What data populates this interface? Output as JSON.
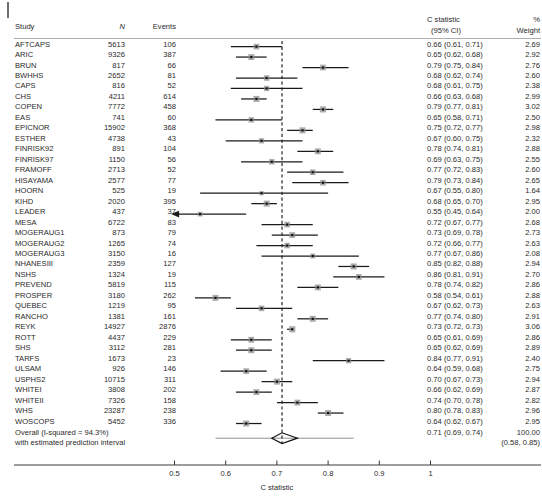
{
  "corner_mark": "tick-mark",
  "headers": {
    "study": "Study",
    "n": "N",
    "events": "Events",
    "cstat_line1": "C statistic",
    "cstat_line2": "(95% CI)",
    "weight_line1": "%",
    "weight_line2": "Weight"
  },
  "axis": {
    "title": "C statistic",
    "ticks": [
      "0.5",
      "0.6",
      "0.7",
      "0.8",
      "0.9",
      "1"
    ],
    "tick_values": [
      0.5,
      0.6,
      0.7,
      0.8,
      0.9,
      1.0
    ],
    "min": 0.45,
    "max": 1.02,
    "reference_line": 0.71
  },
  "footer": {
    "line1": "Overall (I-squared = 94.3%)",
    "line2": "with estimated prediction interval",
    "overall_cstat": "0.71 (0.69, 0.74)",
    "overall_weight": "100.00",
    "prediction_interval": "(0.58, 0.85)"
  },
  "colors": {
    "marker_box": "#8c8c8c",
    "marker_center": "#111111",
    "ci_line": "#1a1a1a",
    "reference_line": "#111111",
    "axis": "#3a3a3a",
    "rule": "#9a9a9a",
    "diamond": "#111111"
  },
  "chart_data": {
    "type": "forest",
    "title": "",
    "xlabel": "C statistic",
    "ylabel": "",
    "xlim": [
      0.45,
      1.02
    ],
    "grid": false,
    "reference_line": 0.71,
    "columns": [
      "Study",
      "N",
      "Events",
      "C statistic (95% CI)",
      "% Weight"
    ],
    "rows": [
      {
        "study": "AFTCAPS",
        "n": "5613",
        "events": "106",
        "est": 0.66,
        "lo": 0.61,
        "hi": 0.71,
        "cstat": "0.66 (0.61, 0.71)",
        "weight": "2.69",
        "arrow": false
      },
      {
        "study": "ARIC",
        "n": "9326",
        "events": "387",
        "est": 0.65,
        "lo": 0.62,
        "hi": 0.68,
        "cstat": "0.65 (0.62, 0.68)",
        "weight": "2.92",
        "arrow": false
      },
      {
        "study": "BRUN",
        "n": "817",
        "events": "66",
        "est": 0.79,
        "lo": 0.75,
        "hi": 0.84,
        "cstat": "0.79 (0.75, 0.84)",
        "weight": "2.76",
        "arrow": false
      },
      {
        "study": "BWHHS",
        "n": "2652",
        "events": "81",
        "est": 0.68,
        "lo": 0.62,
        "hi": 0.74,
        "cstat": "0.68 (0.62, 0.74)",
        "weight": "2.60",
        "arrow": false
      },
      {
        "study": "CAPS",
        "n": "816",
        "events": "52",
        "est": 0.68,
        "lo": 0.61,
        "hi": 0.75,
        "cstat": "0.68 (0.61, 0.75)",
        "weight": "2.38",
        "arrow": false
      },
      {
        "study": "CHS",
        "n": "4211",
        "events": "614",
        "est": 0.66,
        "lo": 0.63,
        "hi": 0.68,
        "cstat": "0.66 (0.63, 0.68)",
        "weight": "2.99",
        "arrow": false
      },
      {
        "study": "COPEN",
        "n": "7772",
        "events": "458",
        "est": 0.79,
        "lo": 0.77,
        "hi": 0.81,
        "cstat": "0.79 (0.77, 0.81)",
        "weight": "3.02",
        "arrow": false
      },
      {
        "study": "EAS",
        "n": "741",
        "events": "60",
        "est": 0.65,
        "lo": 0.58,
        "hi": 0.71,
        "cstat": "0.65 (0.58, 0.71)",
        "weight": "2.50",
        "arrow": false
      },
      {
        "study": "EPICNOR",
        "n": "15902",
        "events": "368",
        "est": 0.75,
        "lo": 0.72,
        "hi": 0.77,
        "cstat": "0.75 (0.72, 0.77)",
        "weight": "2.98",
        "arrow": false
      },
      {
        "study": "ESTHER",
        "n": "4738",
        "events": "43",
        "est": 0.67,
        "lo": 0.6,
        "hi": 0.75,
        "cstat": "0.67 (0.60, 0.75)",
        "weight": "2.32",
        "arrow": false
      },
      {
        "study": "FINRISK92",
        "n": "891",
        "events": "104",
        "est": 0.78,
        "lo": 0.74,
        "hi": 0.81,
        "cstat": "0.78 (0.74, 0.81)",
        "weight": "2.88",
        "arrow": false
      },
      {
        "study": "FINRISK97",
        "n": "1150",
        "events": "56",
        "est": 0.69,
        "lo": 0.63,
        "hi": 0.75,
        "cstat": "0.69 (0.63, 0.75)",
        "weight": "2.55",
        "arrow": false
      },
      {
        "study": "FRAMOFF",
        "n": "2713",
        "events": "52",
        "est": 0.77,
        "lo": 0.72,
        "hi": 0.83,
        "cstat": "0.77 (0.72, 0.83)",
        "weight": "2.60",
        "arrow": false
      },
      {
        "study": "HISAYAMA",
        "n": "2577",
        "events": "77",
        "est": 0.79,
        "lo": 0.73,
        "hi": 0.84,
        "cstat": "0.79 (0.73, 0.84)",
        "weight": "2.65",
        "arrow": false
      },
      {
        "study": "HOORN",
        "n": "525",
        "events": "19",
        "est": 0.67,
        "lo": 0.55,
        "hi": 0.8,
        "cstat": "0.67 (0.55, 0.80)",
        "weight": "1.64",
        "arrow": false
      },
      {
        "study": "KIHD",
        "n": "2020",
        "events": "395",
        "est": 0.68,
        "lo": 0.65,
        "hi": 0.7,
        "cstat": "0.68 (0.65, 0.70)",
        "weight": "2.95",
        "arrow": false
      },
      {
        "study": "LEADER",
        "n": "437",
        "events": "37",
        "est": 0.55,
        "lo": 0.45,
        "hi": 0.64,
        "cstat": "0.55 (0.45, 0.64)",
        "weight": "2.00",
        "arrow": true
      },
      {
        "study": "MESA",
        "n": "6722",
        "events": "83",
        "est": 0.72,
        "lo": 0.67,
        "hi": 0.77,
        "cstat": "0.72 (0.67, 0.77)",
        "weight": "2.68",
        "arrow": false
      },
      {
        "study": "MOGERAUG1",
        "n": "873",
        "events": "79",
        "est": 0.73,
        "lo": 0.69,
        "hi": 0.78,
        "cstat": "0.73 (0.69, 0.78)",
        "weight": "2.73",
        "arrow": false
      },
      {
        "study": "MOGERAUG2",
        "n": "1265",
        "events": "74",
        "est": 0.72,
        "lo": 0.66,
        "hi": 0.77,
        "cstat": "0.72 (0.66, 0.77)",
        "weight": "2.63",
        "arrow": false
      },
      {
        "study": "MOGERAUG3",
        "n": "3150",
        "events": "16",
        "est": 0.77,
        "lo": 0.67,
        "hi": 0.86,
        "cstat": "0.77 (0.67, 0.86)",
        "weight": "2.08",
        "arrow": false
      },
      {
        "study": "NHANESIII",
        "n": "2359",
        "events": "127",
        "est": 0.85,
        "lo": 0.82,
        "hi": 0.88,
        "cstat": "0.85 (0.82, 0.88)",
        "weight": "2.94",
        "arrow": false
      },
      {
        "study": "NSHS",
        "n": "1324",
        "events": "19",
        "est": 0.86,
        "lo": 0.81,
        "hi": 0.91,
        "cstat": "0.86 (0.81, 0.91)",
        "weight": "2.70",
        "arrow": false
      },
      {
        "study": "PREVEND",
        "n": "5819",
        "events": "115",
        "est": 0.78,
        "lo": 0.74,
        "hi": 0.82,
        "cstat": "0.78 (0.74, 0.82)",
        "weight": "2.86",
        "arrow": false
      },
      {
        "study": "PROSPER",
        "n": "3180",
        "events": "262",
        "est": 0.58,
        "lo": 0.54,
        "hi": 0.61,
        "cstat": "0.58 (0.54, 0.61)",
        "weight": "2.88",
        "arrow": false
      },
      {
        "study": "QUEBEC",
        "n": "1219",
        "events": "95",
        "est": 0.67,
        "lo": 0.62,
        "hi": 0.73,
        "cstat": "0.67 (0.62, 0.73)",
        "weight": "2.63",
        "arrow": false
      },
      {
        "study": "RANCHO",
        "n": "1381",
        "events": "161",
        "est": 0.77,
        "lo": 0.74,
        "hi": 0.8,
        "cstat": "0.77 (0.74, 0.80)",
        "weight": "2.91",
        "arrow": false
      },
      {
        "study": "REYK",
        "n": "14927",
        "events": "2876",
        "est": 0.73,
        "lo": 0.72,
        "hi": 0.73,
        "cstat": "0.73 (0.72, 0.73)",
        "weight": "3.06",
        "arrow": false
      },
      {
        "study": "ROTT",
        "n": "4437",
        "events": "229",
        "est": 0.65,
        "lo": 0.61,
        "hi": 0.69,
        "cstat": "0.65 (0.61, 0.69)",
        "weight": "2.86",
        "arrow": false
      },
      {
        "study": "SHS",
        "n": "3112",
        "events": "281",
        "est": 0.65,
        "lo": 0.62,
        "hi": 0.69,
        "cstat": "0.65 (0.62, 0.69)",
        "weight": "2.89",
        "arrow": false
      },
      {
        "study": "TARFS",
        "n": "1673",
        "events": "23",
        "est": 0.84,
        "lo": 0.77,
        "hi": 0.91,
        "cstat": "0.84 (0.77, 0.91)",
        "weight": "2.40",
        "arrow": false
      },
      {
        "study": "ULSAM",
        "n": "926",
        "events": "146",
        "est": 0.64,
        "lo": 0.59,
        "hi": 0.68,
        "cstat": "0.64 (0.59, 0.68)",
        "weight": "2.75",
        "arrow": false
      },
      {
        "study": "USPHS2",
        "n": "10715",
        "events": "311",
        "est": 0.7,
        "lo": 0.67,
        "hi": 0.73,
        "cstat": "0.70 (0.67, 0.73)",
        "weight": "2.94",
        "arrow": false
      },
      {
        "study": "WHITEI",
        "n": "3808",
        "events": "202",
        "est": 0.66,
        "lo": 0.62,
        "hi": 0.69,
        "cstat": "0.66 (0.62, 0.69)",
        "weight": "2.87",
        "arrow": false
      },
      {
        "study": "WHITEII",
        "n": "7326",
        "events": "158",
        "est": 0.74,
        "lo": 0.7,
        "hi": 0.78,
        "cstat": "0.74 (0.70, 0.78)",
        "weight": "2.82",
        "arrow": false
      },
      {
        "study": "WHS",
        "n": "23287",
        "events": "238",
        "est": 0.8,
        "lo": 0.78,
        "hi": 0.83,
        "cstat": "0.80 (0.78, 0.83)",
        "weight": "2.96",
        "arrow": false
      },
      {
        "study": "WOSCOPS",
        "n": "5452",
        "events": "336",
        "est": 0.64,
        "lo": 0.62,
        "hi": 0.67,
        "cstat": "0.64 (0.62, 0.67)",
        "weight": "2.95",
        "arrow": false
      }
    ],
    "overall": {
      "label": "Overall (I-squared = 94.3%)",
      "sublabel": "with estimated prediction interval",
      "est": 0.71,
      "lo": 0.69,
      "hi": 0.74,
      "cstat": "0.71 (0.69, 0.74)",
      "weight": "100.00",
      "pi_lo": 0.58,
      "pi_hi": 0.85,
      "pi_text": "(0.58, 0.85)"
    }
  }
}
